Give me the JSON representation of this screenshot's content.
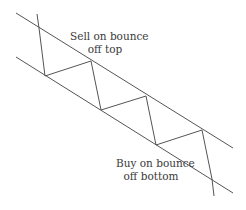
{
  "diagram": {
    "colors": {
      "line": "#555555",
      "text": "#3a3a3a",
      "background": "#ffffff"
    },
    "channel": {
      "upper_line": {
        "x1": 16,
        "y1": 13,
        "x2": 233,
        "y2": 148
      },
      "lower_line": {
        "x1": 16,
        "y1": 57,
        "x2": 233,
        "y2": 193
      }
    },
    "price_path_points": "37,14 39,28 45,76 91,61 101,110 146,96 156,145 202,130 212,179 214,196",
    "labels": {
      "sell": {
        "line1": "Sell on bounce",
        "line2": "off top"
      },
      "buy": {
        "line1": "Buy on bounce",
        "line2": "off bottom"
      }
    }
  }
}
